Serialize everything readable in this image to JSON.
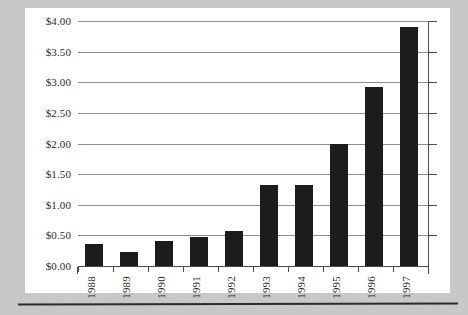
{
  "chart_data": {
    "type": "bar",
    "title": "",
    "subtitle": "",
    "xlabel": "",
    "ylabel": "",
    "categories": [
      "1988",
      "1989",
      "1990",
      "1991",
      "1992",
      "1993",
      "1994",
      "1995",
      "1996",
      "1997"
    ],
    "values": [
      0.36,
      0.23,
      0.41,
      0.48,
      0.57,
      1.33,
      1.33,
      2.0,
      2.93,
      3.9
    ],
    "ylim": [
      0,
      4.0
    ],
    "ytick_values": [
      0.0,
      0.5,
      1.0,
      1.5,
      2.0,
      2.5,
      3.0,
      3.5,
      4.0
    ],
    "ytick_labels": [
      "$0.00",
      "$0.50",
      "$1.00",
      "$1.50",
      "$2.00",
      "$2.50",
      "$3.00",
      "$3.50",
      "$4.00"
    ],
    "grid": true,
    "legend": false,
    "legend_position": "none",
    "bar_color": "#1c1c1c",
    "gridline_color": "#8e8e8e",
    "axis_color": "#4a4a4a",
    "plot_background": "#ffffff",
    "page_background": "#c8c8c8",
    "xlabel_rotation": 90
  }
}
